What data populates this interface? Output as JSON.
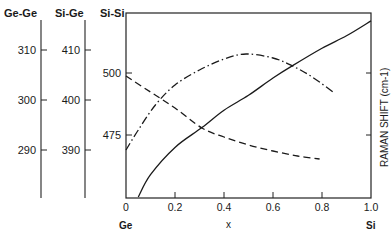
{
  "chart_data": {
    "type": "line",
    "title": "",
    "xlabel": "x",
    "ylabel": "RAMAN SHIFT (cm-1)",
    "xlim": [
      0,
      1.0
    ],
    "x_ticks": [
      "0",
      "0.2",
      "0.4",
      "0.6",
      "0.8",
      "1.0"
    ],
    "x_end_labels": {
      "left": "Ge",
      "right": "Si"
    },
    "axes": [
      {
        "name": "Ge-Ge",
        "ticks": [
          "310",
          "300",
          "290"
        ],
        "tick_values": [
          310,
          300,
          290
        ],
        "range": [
          280.4,
          317.4
        ]
      },
      {
        "name": "Si-Ge",
        "ticks": [
          "410",
          "400",
          "390"
        ],
        "tick_values": [
          410,
          400,
          390
        ],
        "range": [
          380.4,
          417.4
        ]
      },
      {
        "name": "Si-Si",
        "ticks": [
          "500",
          "475"
        ],
        "tick_values": [
          500,
          475
        ],
        "range": [
          449.6,
          524.2
        ]
      }
    ],
    "series": [
      {
        "name": "Si-Si",
        "style": "solid",
        "axis": "Si-Si",
        "x": [
          0.05,
          0.1,
          0.2,
          0.31,
          0.4,
          0.5,
          0.6,
          0.68,
          0.8,
          0.9,
          1.0
        ],
        "y": [
          450,
          459,
          470,
          478,
          485,
          491,
          498,
          503,
          510,
          515,
          521
        ]
      },
      {
        "name": "Ge-Ge",
        "style": "dashed",
        "axis": "Ge-Ge",
        "x": [
          0,
          0.1,
          0.2,
          0.31,
          0.4,
          0.5,
          0.6,
          0.7,
          0.79
        ],
        "y": [
          304.8,
          301.6,
          298.4,
          294.4,
          292.6,
          291.0,
          289.8,
          288.8,
          288.2
        ]
      },
      {
        "name": "Si-Ge",
        "style": "dash-dot",
        "axis": "Si-Ge",
        "x": [
          0,
          0.05,
          0.12,
          0.2,
          0.3,
          0.4,
          0.49,
          0.6,
          0.68,
          0.76,
          0.85
        ],
        "y": [
          390.0,
          394.0,
          399.0,
          403.0,
          406.0,
          408.2,
          409.2,
          408.4,
          406.8,
          404.6,
          401.4
        ]
      }
    ],
    "grid": false,
    "legend": "none"
  },
  "labels": {
    "axis_gege": "Ge-Ge",
    "axis_sige": "Si-Ge",
    "axis_sisi": "Si-Si",
    "ylabel": "RAMAN SHIFT (cm-1)",
    "xlabel": "x",
    "x_left": "Ge",
    "x_right": "Si"
  }
}
